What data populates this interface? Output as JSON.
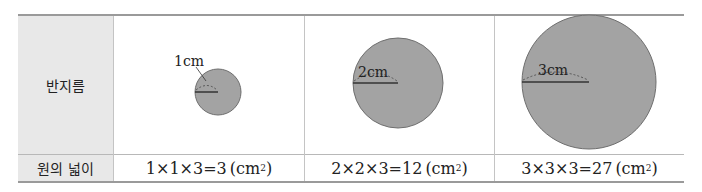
{
  "table": {
    "row_headers": {
      "radius": "반지름",
      "area": "원의 넓이"
    },
    "columns": [
      {
        "radius_label": "1cm",
        "radius_cm": 1,
        "area_formula": "1×1×3=3",
        "unit": "(cm",
        "unit_exp": "2",
        "unit_close": ")"
      },
      {
        "radius_label": "2cm",
        "radius_cm": 2,
        "area_formula": "2×2×3=12",
        "unit": "(cm",
        "unit_exp": "2",
        "unit_close": ")"
      },
      {
        "radius_label": "3cm",
        "radius_cm": 3,
        "area_formula": "3×3×3=27",
        "unit": "(cm",
        "unit_exp": "2",
        "unit_close": ")"
      }
    ]
  },
  "colors": {
    "circle_fill": "#a3a3a3",
    "circle_stroke": "#6e6e6e",
    "header_bg": "#e8e8e8"
  }
}
